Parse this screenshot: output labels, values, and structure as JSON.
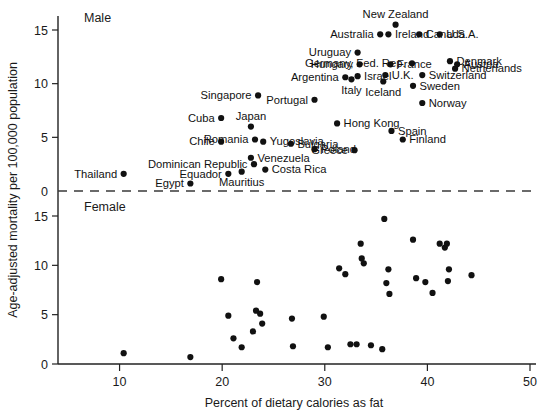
{
  "chart_data": {
    "type": "scatter",
    "title": "",
    "xlabel": "Percent of dietary calories as fat",
    "ylabel": "Age-adjusted mortality per 100,000 population",
    "xlim": [
      4,
      50
    ],
    "xticks": [
      10,
      20,
      30,
      40,
      50
    ],
    "grid": false,
    "legend_position": "none",
    "panels": [
      {
        "name": "Male",
        "label": "Male",
        "yticks": [
          0,
          5,
          10,
          15
        ],
        "ylim": [
          0,
          17
        ],
        "y_inverted": false,
        "points": [
          {
            "label": "Thailand",
            "x": 10.4,
            "y": 1.6,
            "label_side": "left"
          },
          {
            "label": "Egypt",
            "x": 16.9,
            "y": 0.7,
            "label_side": "left"
          },
          {
            "label": "Equador",
            "x": 20.6,
            "y": 1.6,
            "label_side": "left"
          },
          {
            "label": "Mauritius",
            "x": 21.9,
            "y": 1.8,
            "label_side": "below"
          },
          {
            "label": "Dominican Republic",
            "x": 23.1,
            "y": 2.5,
            "label_side": "left"
          },
          {
            "label": "Chile",
            "x": 19.9,
            "y": 4.6,
            "label_side": "left"
          },
          {
            "label": "Cuba",
            "x": 19.9,
            "y": 6.8,
            "label_side": "left"
          },
          {
            "label": "Japan",
            "x": 22.8,
            "y": 6.0,
            "label_side": "above"
          },
          {
            "label": "Romania",
            "x": 23.2,
            "y": 4.8,
            "label_side": "left"
          },
          {
            "label": "Singapore",
            "x": 23.5,
            "y": 8.9,
            "label_side": "left"
          },
          {
            "label": "Venezuela",
            "x": 22.8,
            "y": 3.1,
            "label_side": "right"
          },
          {
            "label": "Costa Rica",
            "x": 24.2,
            "y": 2.0,
            "label_side": "right"
          },
          {
            "label": "Yugoslavia",
            "x": 24.0,
            "y": 4.6,
            "label_side": "right"
          },
          {
            "label": "Bulgaria",
            "x": 26.7,
            "y": 4.4,
            "label_side": "right"
          },
          {
            "label": "Poland",
            "x": 29.0,
            "y": 3.9,
            "label_side": "right"
          },
          {
            "label": "Portugal",
            "x": 29.0,
            "y": 8.5,
            "label_side": "left"
          },
          {
            "label": "Hong Kong",
            "x": 31.2,
            "y": 6.3,
            "label_side": "right"
          },
          {
            "label": "Greece",
            "x": 32.9,
            "y": 3.8,
            "label_side": "left"
          },
          {
            "label": "Argentina",
            "x": 32.0,
            "y": 10.6,
            "label_side": "left"
          },
          {
            "label": "Italy",
            "x": 32.6,
            "y": 10.4,
            "label_side": "below"
          },
          {
            "label": "Israel",
            "x": 33.2,
            "y": 10.7,
            "label_side": "right"
          },
          {
            "label": "Hungary",
            "x": 33.4,
            "y": 11.8,
            "label_side": "left"
          },
          {
            "label": "Uruguay",
            "x": 33.2,
            "y": 12.9,
            "label_side": "left"
          },
          {
            "label": "Australia",
            "x": 35.4,
            "y": 14.6,
            "label_side": "left"
          },
          {
            "label": "Ireland",
            "x": 36.2,
            "y": 14.6,
            "label_side": "right"
          },
          {
            "label": "Iceland",
            "x": 35.7,
            "y": 10.2,
            "label_side": "below"
          },
          {
            "label": "New Zealand",
            "x": 36.9,
            "y": 15.5,
            "label_side": "above"
          },
          {
            "label": "Germany, Fed. Rep.",
            "x": 38.5,
            "y": 11.9,
            "label_side": "left"
          },
          {
            "label": "France",
            "x": 36.4,
            "y": 11.8,
            "label_side": "right"
          },
          {
            "label": "U.K.",
            "x": 35.9,
            "y": 10.8,
            "label_side": "right"
          },
          {
            "label": "Spain",
            "x": 36.5,
            "y": 5.6,
            "label_side": "right"
          },
          {
            "label": "Finland",
            "x": 37.6,
            "y": 4.8,
            "label_side": "right"
          },
          {
            "label": "Canada",
            "x": 39.2,
            "y": 14.6,
            "label_side": "right"
          },
          {
            "label": "Sweden",
            "x": 38.6,
            "y": 9.8,
            "label_side": "right"
          },
          {
            "label": "Norway",
            "x": 39.5,
            "y": 8.2,
            "label_side": "right"
          },
          {
            "label": "Switzerland",
            "x": 39.5,
            "y": 10.8,
            "label_side": "right"
          },
          {
            "label": "U.S.A.",
            "x": 41.2,
            "y": 14.6,
            "label_side": "right"
          },
          {
            "label": "Denmark",
            "x": 42.2,
            "y": 12.1,
            "label_side": "right"
          },
          {
            "label": "Netherlands",
            "x": 42.7,
            "y": 11.4,
            "label_side": "right"
          },
          {
            "label": "Austria",
            "x": 42.9,
            "y": 11.8,
            "label_side": "right"
          }
        ]
      },
      {
        "name": "Female",
        "label": "Female",
        "yticks": [
          0,
          5,
          10,
          15
        ],
        "ylim": [
          0,
          17
        ],
        "y_inverted": true,
        "points": [
          {
            "x": 10.4,
            "y": 1.1
          },
          {
            "x": 16.9,
            "y": 0.7
          },
          {
            "x": 19.9,
            "y": 8.6
          },
          {
            "x": 20.6,
            "y": 4.9
          },
          {
            "x": 21.1,
            "y": 2.6
          },
          {
            "x": 21.9,
            "y": 1.7
          },
          {
            "x": 23.0,
            "y": 3.3
          },
          {
            "x": 23.3,
            "y": 5.4
          },
          {
            "x": 23.7,
            "y": 5.1
          },
          {
            "x": 23.9,
            "y": 4.1
          },
          {
            "x": 23.4,
            "y": 8.3
          },
          {
            "x": 26.8,
            "y": 4.6
          },
          {
            "x": 26.9,
            "y": 1.8
          },
          {
            "x": 29.9,
            "y": 4.8
          },
          {
            "x": 30.3,
            "y": 1.7
          },
          {
            "x": 31.4,
            "y": 9.7
          },
          {
            "x": 32.0,
            "y": 9.1
          },
          {
            "x": 32.5,
            "y": 2.0
          },
          {
            "x": 33.1,
            "y": 2.0
          },
          {
            "x": 33.5,
            "y": 12.2
          },
          {
            "x": 33.6,
            "y": 10.7
          },
          {
            "x": 33.8,
            "y": 10.2
          },
          {
            "x": 34.5,
            "y": 1.9
          },
          {
            "x": 35.6,
            "y": 1.5
          },
          {
            "x": 35.8,
            "y": 14.7
          },
          {
            "x": 36.2,
            "y": 9.6
          },
          {
            "x": 36.0,
            "y": 8.2
          },
          {
            "x": 36.3,
            "y": 7.1
          },
          {
            "x": 38.6,
            "y": 12.6
          },
          {
            "x": 38.9,
            "y": 8.7
          },
          {
            "x": 39.8,
            "y": 8.3
          },
          {
            "x": 40.5,
            "y": 7.2
          },
          {
            "x": 41.2,
            "y": 12.2
          },
          {
            "x": 41.7,
            "y": 11.8
          },
          {
            "x": 41.9,
            "y": 12.2
          },
          {
            "x": 42.1,
            "y": 9.6
          },
          {
            "x": 42.0,
            "y": 8.4
          },
          {
            "x": 44.3,
            "y": 9.0
          }
        ]
      }
    ]
  }
}
